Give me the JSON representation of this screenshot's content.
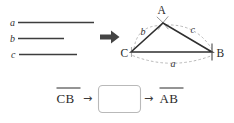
{
  "figure": {
    "title_visible": false,
    "given_segments": {
      "items": [
        {
          "label": "a",
          "relative_length": 76
        },
        {
          "label": "b",
          "relative_length": 46
        },
        {
          "label": "c",
          "relative_length": 58
        }
      ]
    },
    "transform_arrow": {
      "glyph": "⇒"
    },
    "triangle": {
      "vertices": [
        {
          "label": "A",
          "position": "apex"
        },
        {
          "label": "B",
          "position": "bottom-right"
        },
        {
          "label": "C",
          "position": "bottom-left"
        }
      ],
      "side_labels": [
        {
          "label": "b",
          "between": "C-A"
        },
        {
          "label": "c",
          "between": "A-B"
        },
        {
          "label": "a",
          "between": "C-B"
        }
      ]
    },
    "flow": {
      "start_label": "CB",
      "arrow1": "→",
      "box_value": "",
      "arrow2": "→",
      "end_label": "AB"
    }
  },
  "colors": {
    "background": "#ffffff",
    "ink": "#2b2b2b",
    "segment": "#3d3d3d",
    "auxiliary_arc": "#a6a6a6",
    "box_border": "#b9b9b9"
  }
}
